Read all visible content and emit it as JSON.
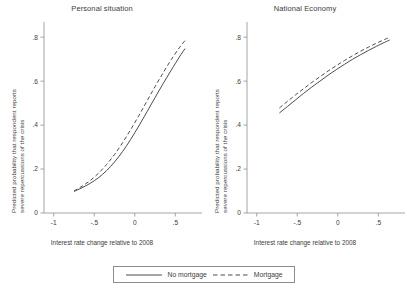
{
  "figure": {
    "background": "#ffffff",
    "line_color": "#4d4d4d",
    "axis_color": "#9a9a9a",
    "text_color": "#3c3c3c"
  },
  "legend": {
    "position": "bottom-center",
    "entries": [
      {
        "label": "No mortgage",
        "style": "solid"
      },
      {
        "label": "Mortgage",
        "style": "dashed"
      }
    ]
  },
  "axis_labels": {
    "y_line1": "Predicted probability that respondent reports",
    "y_line2": "severe repercussions of the crisis",
    "x": "Interest rate change relative to 2008"
  },
  "chart_data": [
    {
      "type": "line",
      "title": "Personal situation",
      "xlabel": "Interest rate change relative to 2008",
      "ylabel": "Predicted probability that respondent reports severe repercussions of the crisis",
      "xlim": [
        -1.12,
        0.78
      ],
      "ylim": [
        0,
        0.86
      ],
      "xticks": [
        -1,
        -0.5,
        0,
        0.5
      ],
      "xticklabels": [
        "-1",
        "-.5",
        "0",
        ".5"
      ],
      "yticks": [
        0,
        0.2,
        0.4,
        0.6,
        0.8
      ],
      "yticklabels": [
        "0",
        ".2",
        ".4",
        ".6",
        ".8"
      ],
      "grid": false,
      "series": [
        {
          "name": "No mortgage",
          "style": "solid",
          "x": [
            -0.75,
            -0.65,
            -0.55,
            -0.45,
            -0.35,
            -0.25,
            -0.15,
            -0.05,
            0.05,
            0.15,
            0.25,
            0.35,
            0.45,
            0.55,
            0.62
          ],
          "values": [
            0.098,
            0.115,
            0.135,
            0.16,
            0.192,
            0.232,
            0.28,
            0.335,
            0.396,
            0.46,
            0.525,
            0.589,
            0.65,
            0.71,
            0.748
          ]
        },
        {
          "name": "Mortgage",
          "style": "dashed",
          "x": [
            -0.75,
            -0.65,
            -0.55,
            -0.45,
            -0.35,
            -0.25,
            -0.15,
            -0.05,
            0.05,
            0.15,
            0.25,
            0.35,
            0.45,
            0.55,
            0.62
          ],
          "values": [
            0.1,
            0.122,
            0.148,
            0.18,
            0.22,
            0.266,
            0.32,
            0.38,
            0.443,
            0.509,
            0.575,
            0.638,
            0.698,
            0.752,
            0.785
          ]
        }
      ]
    },
    {
      "type": "line",
      "title": "National Economy",
      "xlabel": "Interest rate change relative to 2008",
      "ylabel": "Predicted probability that respondent reports severe repercussions of the crisis",
      "xlim": [
        -1.12,
        0.78
      ],
      "ylim": [
        0,
        0.86
      ],
      "xticks": [
        -1,
        -0.5,
        0,
        0.5
      ],
      "xticklabels": [
        "-1",
        "-.5",
        "0",
        ".5"
      ],
      "yticks": [
        0,
        0.2,
        0.4,
        0.6,
        0.8
      ],
      "yticklabels": [
        "0",
        ".2",
        ".4",
        ".6",
        ".8"
      ],
      "grid": false,
      "series": [
        {
          "name": "No mortgage",
          "style": "solid",
          "x": [
            -0.72,
            -0.62,
            -0.52,
            -0.42,
            -0.32,
            -0.22,
            -0.12,
            -0.02,
            0.08,
            0.18,
            0.28,
            0.38,
            0.48,
            0.58,
            0.64
          ],
          "values": [
            0.455,
            0.485,
            0.515,
            0.545,
            0.573,
            0.6,
            0.627,
            0.652,
            0.676,
            0.699,
            0.72,
            0.74,
            0.759,
            0.777,
            0.787
          ]
        },
        {
          "name": "Mortgage",
          "style": "dashed",
          "x": [
            -0.72,
            -0.62,
            -0.52,
            -0.42,
            -0.32,
            -0.22,
            -0.12,
            -0.02,
            0.08,
            0.18,
            0.28,
            0.38,
            0.48,
            0.58,
            0.64
          ],
          "values": [
            0.478,
            0.508,
            0.538,
            0.566,
            0.594,
            0.62,
            0.646,
            0.67,
            0.693,
            0.715,
            0.736,
            0.755,
            0.773,
            0.79,
            0.799
          ]
        }
      ]
    }
  ]
}
